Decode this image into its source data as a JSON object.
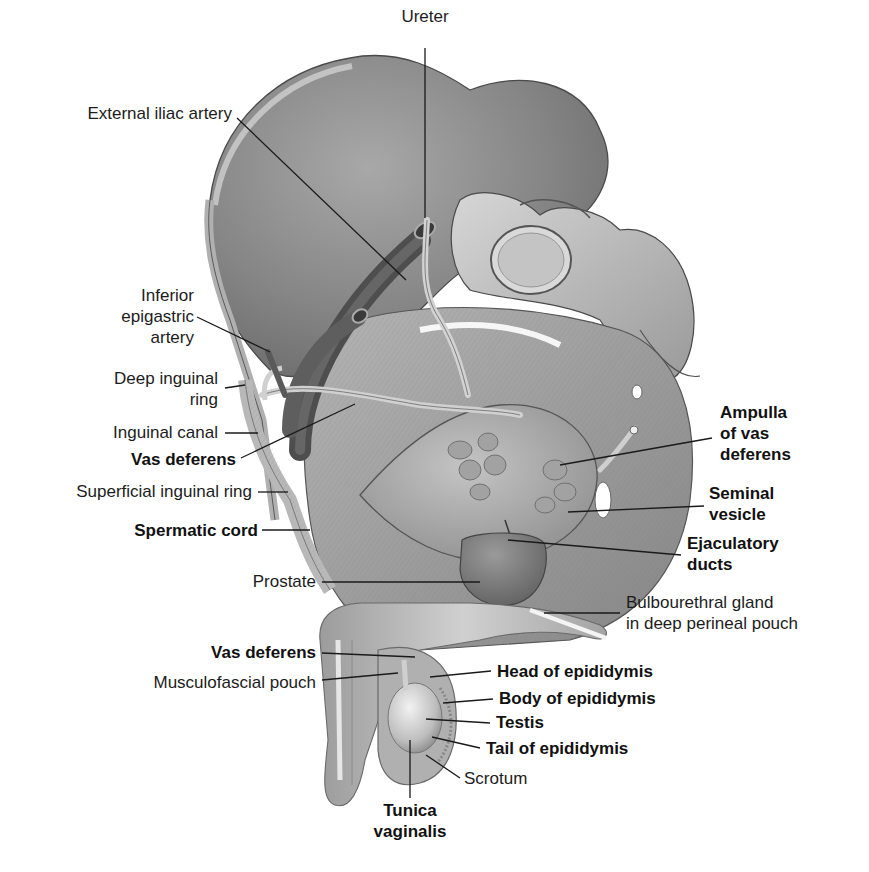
{
  "diagram": {
    "style": "grayscale medical illustration with leader-line labels",
    "colors": {
      "background": "#ffffff",
      "label_text": "#1c1c1c",
      "leader_line": "#1a1a1a",
      "bone": "#8c8c8c",
      "bone_light": "#c9c9c9",
      "muscle": "#9a9a9a",
      "vessel_dark": "#5a5a5a",
      "duct_light": "#d4d4d4"
    },
    "labels": {
      "ureter": {
        "lines": [
          "Ureter"
        ],
        "bold": false
      },
      "external_iliac_artery": {
        "lines": [
          "External iliac artery"
        ],
        "bold": false
      },
      "inferior_epigastric_artery": {
        "lines": [
          "Inferior",
          "epigastric",
          "artery"
        ],
        "bold": false
      },
      "deep_inguinal_ring": {
        "lines": [
          "Deep inguinal",
          "ring"
        ],
        "bold": false
      },
      "inguinal_canal": {
        "lines": [
          "Inguinal canal"
        ],
        "bold": false
      },
      "vas_deferens_upper": {
        "lines": [
          "Vas deferens"
        ],
        "bold": true
      },
      "superficial_inguinal_ring": {
        "lines": [
          "Superficial inguinal ring"
        ],
        "bold": false
      },
      "spermatic_cord": {
        "lines": [
          "Spermatic cord"
        ],
        "bold": true
      },
      "prostate": {
        "lines": [
          "Prostate"
        ],
        "bold": false
      },
      "ampulla_of_vas_deferens": {
        "lines": [
          "Ampulla",
          "of vas",
          "deferens"
        ],
        "bold": true
      },
      "seminal_vesicle": {
        "lines": [
          "Seminal",
          "vesicle"
        ],
        "bold": true
      },
      "ejaculatory_ducts": {
        "lines": [
          "Ejaculatory",
          "ducts"
        ],
        "bold": true
      },
      "bulbourethral_gland": {
        "lines": [
          "Bulbourethral gland",
          "in deep perineal pouch"
        ],
        "bold": false
      },
      "vas_deferens_lower": {
        "lines": [
          "Vas deferens"
        ],
        "bold": true
      },
      "musculofascial_pouch": {
        "lines": [
          "Musculofascial pouch"
        ],
        "bold": false
      },
      "head_of_epididymis": {
        "lines": [
          "Head of epididymis"
        ],
        "bold": true
      },
      "body_of_epididymis": {
        "lines": [
          "Body of epididymis"
        ],
        "bold": true
      },
      "testis": {
        "lines": [
          "Testis"
        ],
        "bold": true
      },
      "tail_of_epididymis": {
        "lines": [
          "Tail of epididymis"
        ],
        "bold": true
      },
      "scrotum": {
        "lines": [
          "Scrotum"
        ],
        "bold": false
      },
      "tunica_vaginalis": {
        "lines": [
          "Tunica",
          "vaginalis"
        ],
        "bold": true
      }
    }
  }
}
